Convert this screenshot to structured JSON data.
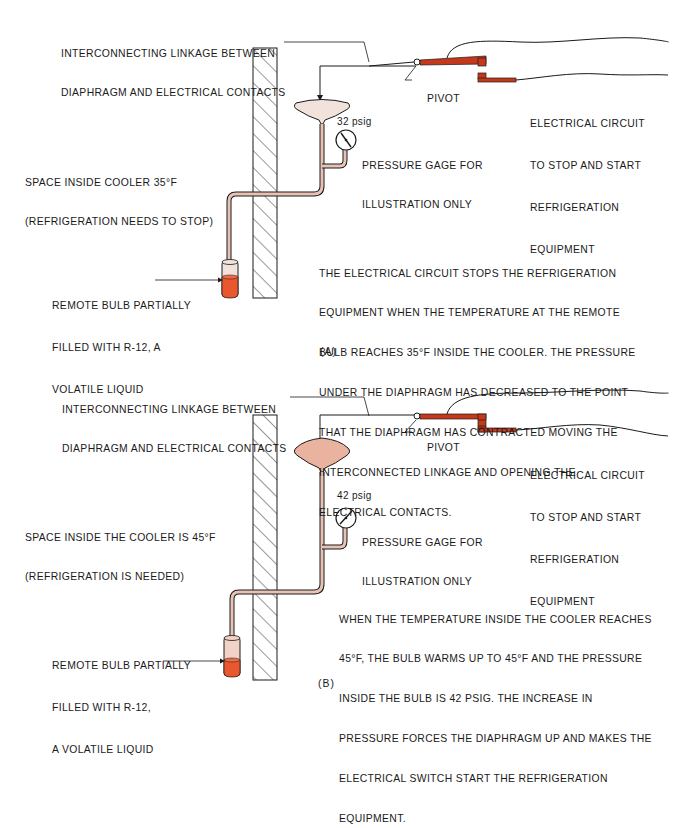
{
  "colors": {
    "copper_tube": "#e8c3b5",
    "diaphragm_a": "#f1e3dc",
    "diaphragm_b": "#eab3a0",
    "liquid": "#e8572e",
    "contacts": "#c4391c",
    "line": "#1a1a1a"
  },
  "panel_a": {
    "linkage_label_line1": "INTERCONNECTING LINKAGE BETWEEN",
    "linkage_label_line2": "DIAPHRAGM AND ELECTRICAL CONTACTS",
    "pivot_label": "PIVOT",
    "circuit_label_line1": "ELECTRICAL CIRCUIT",
    "circuit_label_line2": "TO STOP AND START",
    "circuit_label_line3": "REFRIGERATION",
    "circuit_label_line4": "EQUIPMENT",
    "space_label_line1": "SPACE INSIDE COOLER 35°F",
    "space_label_line2": "(REFRIGERATION NEEDS TO STOP)",
    "gauge_reading": "32 psig",
    "gauge_label_line1": "PRESSURE GAGE FOR",
    "gauge_label_line2": "ILLUSTRATION ONLY",
    "bulb_label_line1": "REMOTE BULB PARTIALLY",
    "bulb_label_line2": "FILLED WITH R-12, A",
    "bulb_label_line3": "VOLATILE LIQUID",
    "description": [
      "THE ELECTRICAL CIRCUIT STOPS THE REFRIGERATION",
      "EQUIPMENT WHEN THE TEMPERATURE AT THE REMOTE",
      "BULB REACHES 35°F INSIDE THE COOLER. THE PRESSURE",
      "UNDER THE DIAPHRAGM HAS DECREASED TO THE POINT",
      "THAT THE DIAPHRAGM HAS CONTRACTED MOVING THE",
      "INTERCONNECTED LINKAGE AND OPENING THE",
      "ELECTRICAL CONTACTS."
    ],
    "caption": "(A)",
    "contacts_state": "open"
  },
  "panel_b": {
    "linkage_label_line1": "INTERCONNECTING LINKAGE BETWEEN",
    "linkage_label_line2": "DIAPHRAGM AND ELECTRICAL CONTACTS",
    "pivot_label": "PIVOT",
    "circuit_label_line1": "ELECTRICAL CIRCUIT",
    "circuit_label_line2": "TO STOP AND START",
    "circuit_label_line3": "REFRIGERATION",
    "circuit_label_line4": "EQUIPMENT",
    "space_label_line1": "SPACE INSIDE THE COOLER IS 45°F",
    "space_label_line2": "(REFRIGERATION IS NEEDED)",
    "gauge_reading": "42 psig",
    "gauge_label_line1": "PRESSURE GAGE FOR",
    "gauge_label_line2": "ILLUSTRATION ONLY",
    "bulb_label_line1": "REMOTE BULB PARTIALLY",
    "bulb_label_line2": "FILLED WITH R-12,",
    "bulb_label_line3": "A VOLATILE LIQUID",
    "description": [
      "WHEN THE TEMPERATURE INSIDE THE COOLER REACHES",
      "45°F, THE BULB WARMS UP TO 45°F AND THE PRESSURE",
      "INSIDE THE BULB IS 42 psig. THE INCREASE IN",
      "PRESSURE FORCES THE DIAPHRAGM UP AND MAKES THE",
      "ELECTRICAL SWITCH START THE REFRIGERATION",
      "EQUIPMENT."
    ],
    "caption": "(B)",
    "contacts_state": "closed"
  }
}
